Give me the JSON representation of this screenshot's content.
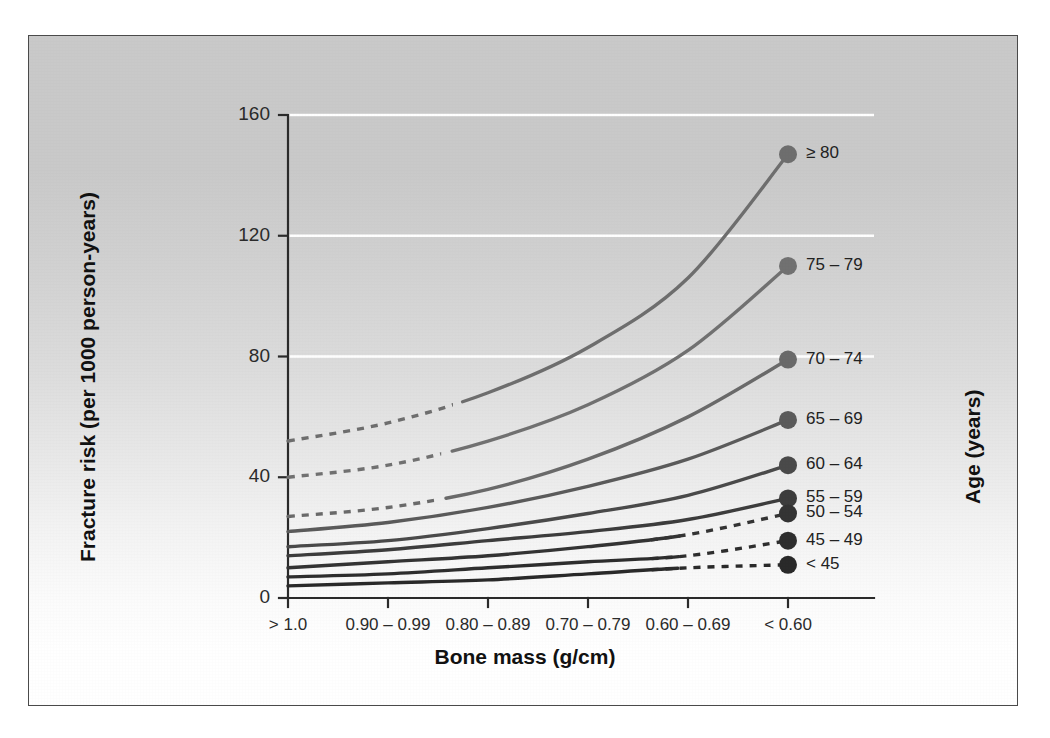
{
  "figure": {
    "background_top_color": "#c9c9c9",
    "background_bottom_color": "#ffffff",
    "frame_color": "#4a4a4a",
    "gridline_color": "#ffffff"
  },
  "chart_data": {
    "type": "line",
    "title": "",
    "xlabel": "Bone mass (g/cm)",
    "ylabel": "Fracture risk (per 1000 person-years)",
    "legend_title": "Age (years)",
    "legend_position": "right",
    "grid": "horizontal-white",
    "categories": [
      "> 1.0",
      "0.90 – 0.99",
      "0.80 – 0.89",
      "0.70 – 0.79",
      "0.60 – 0.69",
      "< 0.60"
    ],
    "xtick_labels": [
      "> 1.0",
      "0.90 – 0.99",
      "0.80 – 0.89",
      "0.70 – 0.79",
      "0.60 – 0.69",
      "< 0.60"
    ],
    "ytick_labels": [
      "0",
      "40",
      "80",
      "120",
      "160"
    ],
    "ytick_values": [
      0,
      40,
      80,
      120,
      160
    ],
    "ylim": [
      0,
      160
    ],
    "gridline_values": [
      80,
      120,
      160
    ],
    "series": [
      {
        "name": "≥ 80",
        "values": [
          52,
          58,
          68,
          83,
          106,
          147
        ],
        "color": "#6e6e6e",
        "dash_segment": "left",
        "marker": true
      },
      {
        "name": "75 – 79",
        "values": [
          40,
          44,
          52,
          64,
          82,
          110
        ],
        "color": "#717171",
        "dash_segment": "left",
        "marker": true
      },
      {
        "name": "70 – 74",
        "values": [
          27,
          30,
          36,
          46,
          60,
          79
        ],
        "color": "#6a6a6a",
        "dash_segment": "left",
        "marker": true
      },
      {
        "name": "65 – 69",
        "values": [
          22,
          25,
          30,
          37,
          46,
          59
        ],
        "color": "#5b5b5b",
        "dash_segment": "none",
        "marker": true
      },
      {
        "name": "60 – 64",
        "values": [
          17,
          19,
          23,
          28,
          34,
          44
        ],
        "color": "#4a4a4a",
        "dash_segment": "none",
        "marker": true
      },
      {
        "name": "55 – 59",
        "values": [
          14,
          16,
          19,
          22,
          26,
          33
        ],
        "color": "#3d3d3d",
        "dash_segment": "none",
        "marker": true
      },
      {
        "name": "50 – 54",
        "values": [
          10,
          12,
          14,
          17,
          21,
          28
        ],
        "color": "#343434",
        "dash_segment": "right",
        "marker": true
      },
      {
        "name": "45 – 49",
        "values": [
          7,
          8,
          10,
          12,
          14,
          19
        ],
        "color": "#2e2e2e",
        "dash_segment": "right",
        "marker": true
      },
      {
        "name": "< 45",
        "values": [
          4,
          5,
          6,
          8,
          10,
          11
        ],
        "color": "#2a2a2a",
        "dash_segment": "right",
        "marker": true
      }
    ]
  }
}
